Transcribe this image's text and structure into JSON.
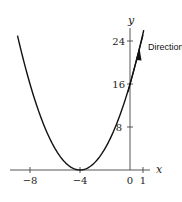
{
  "chart_data": {
    "type": "line",
    "title": "",
    "xlabel": "x",
    "ylabel": "y",
    "xlim": [
      -9.6,
      1.6
    ],
    "ylim": [
      0,
      27
    ],
    "x_ticks": [
      -8,
      -4,
      0,
      1
    ],
    "y_ticks": [
      8,
      16,
      24
    ],
    "series": [
      {
        "name": "y = (x+4)^2",
        "function": "(x+4)^2",
        "x_range": [
          -9,
          1.1
        ]
      },
      {
        "name": "Direction",
        "function": "tangent line at x=0, slope 8",
        "points": [
          [
            -0.2,
            14.4
          ],
          [
            0.9,
            23.2
          ]
        ],
        "arrow": true
      }
    ],
    "annotations": [
      {
        "text": "Direction",
        "x": 1.3,
        "y": 22.5
      }
    ],
    "grid": false,
    "legend": "none"
  },
  "labels": {
    "x_axis": "x",
    "y_axis": "y",
    "tick_m8": "−8",
    "tick_m4": "−4",
    "tick_0": "0",
    "tick_1": "1",
    "tick_8": "8",
    "tick_16": "16",
    "tick_24": "24",
    "direction": "Direction"
  }
}
